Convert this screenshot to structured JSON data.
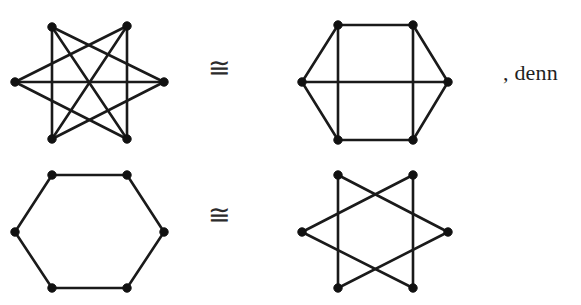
{
  "page": {
    "width": 581,
    "height": 305,
    "background": "#ffffff",
    "ink_color": "#1a1a1a"
  },
  "relations": {
    "congruent_symbol": "≅",
    "top_label": "≅",
    "bottom_label": "≅"
  },
  "trailing_text": ", denn",
  "figures": [
    {
      "id": "graph-top-left",
      "name": "star-hexagon-graph-k33",
      "origin": [
        15,
        25
      ],
      "width": 150,
      "height": 115,
      "vertex_radius": 4.2,
      "vertices": [
        {
          "label": "1",
          "x": 37,
          "y": 2
        },
        {
          "label": "2",
          "x": 112,
          "y": 1
        },
        {
          "label": "3",
          "x": 149,
          "y": 57
        },
        {
          "label": "4",
          "x": 112,
          "y": 114
        },
        {
          "label": "5",
          "x": 37,
          "y": 114
        },
        {
          "label": "6",
          "x": 0,
          "y": 57
        }
      ],
      "edges": [
        [
          0,
          2
        ],
        [
          0,
          4
        ],
        [
          0,
          3
        ],
        [
          1,
          3
        ],
        [
          1,
          5
        ],
        [
          1,
          4
        ],
        [
          2,
          4
        ],
        [
          2,
          5
        ],
        [
          3,
          5
        ]
      ]
    },
    {
      "id": "graph-top-right",
      "name": "hexagon-with-chords-graph",
      "origin": [
        302,
        25
      ],
      "width": 146,
      "height": 115,
      "vertex_radius": 4.2,
      "vertices": [
        {
          "label": "1",
          "x": 36,
          "y": 0
        },
        {
          "label": "2",
          "x": 111,
          "y": 0
        },
        {
          "label": "3",
          "x": 146,
          "y": 57
        },
        {
          "label": "4",
          "x": 111,
          "y": 115
        },
        {
          "label": "5",
          "x": 36,
          "y": 115
        },
        {
          "label": "6",
          "x": 0,
          "y": 57
        }
      ],
      "edges": [
        [
          0,
          1
        ],
        [
          1,
          2
        ],
        [
          2,
          3
        ],
        [
          3,
          4
        ],
        [
          4,
          5
        ],
        [
          5,
          0
        ],
        [
          0,
          4
        ],
        [
          1,
          3
        ],
        [
          2,
          5
        ]
      ]
    },
    {
      "id": "graph-bottom-left",
      "name": "plain-hexagon-cycle-graph",
      "origin": [
        15,
        175
      ],
      "width": 149,
      "height": 113,
      "vertex_radius": 4.2,
      "vertices": [
        {
          "label": "1",
          "x": 37,
          "y": 0
        },
        {
          "label": "2",
          "x": 112,
          "y": 0
        },
        {
          "label": "3",
          "x": 149,
          "y": 57
        },
        {
          "label": "4",
          "x": 112,
          "y": 113
        },
        {
          "label": "5",
          "x": 37,
          "y": 113
        },
        {
          "label": "6",
          "x": 0,
          "y": 57
        }
      ],
      "edges": [
        [
          0,
          1
        ],
        [
          1,
          2
        ],
        [
          2,
          3
        ],
        [
          3,
          4
        ],
        [
          4,
          5
        ],
        [
          5,
          0
        ]
      ]
    },
    {
      "id": "graph-bottom-right",
      "name": "star-polygon-hexagon-graph",
      "origin": [
        302,
        175
      ],
      "width": 146,
      "height": 113,
      "vertex_radius": 4.2,
      "vertices": [
        {
          "label": "1",
          "x": 36,
          "y": 0
        },
        {
          "label": "2",
          "x": 111,
          "y": 0
        },
        {
          "label": "3",
          "x": 146,
          "y": 57
        },
        {
          "label": "4",
          "x": 111,
          "y": 113
        },
        {
          "label": "5",
          "x": 36,
          "y": 113
        },
        {
          "label": "6",
          "x": 0,
          "y": 57
        }
      ],
      "edges": [
        [
          0,
          2
        ],
        [
          2,
          4
        ],
        [
          4,
          0
        ],
        [
          1,
          3
        ],
        [
          3,
          5
        ],
        [
          5,
          1
        ]
      ]
    }
  ]
}
